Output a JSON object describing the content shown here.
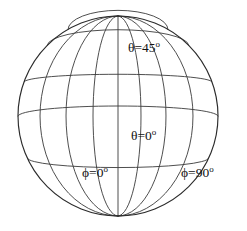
{
  "figure": {
    "background_color": "#ffffff",
    "line_color": "#3a3a3a",
    "text_color": "#111111"
  },
  "globe": {
    "center_x": 118,
    "center_y": 116,
    "radius": 100,
    "north_pole_label": "north-pole",
    "south_pole_label": "south-pole",
    "latitude_count": 5,
    "meridian_count": 7
  },
  "labels": {
    "theta_45": {
      "base": "θ=45",
      "degree": "o"
    },
    "theta_0": {
      "base": "θ=0",
      "degree": "o"
    },
    "phi_0": {
      "base": "ϕ=0",
      "degree": "o"
    },
    "phi_90": {
      "base": "ϕ=90",
      "degree": "o"
    }
  },
  "chart_data": {
    "type": "scatter",
    "xlabel": "",
    "ylabel": "",
    "projection": "orthographic",
    "grid": true,
    "legend_position": "none",
    "sphere": {
      "center": [
        118,
        116
      ],
      "radius": 100,
      "tilt_deg": 0
    },
    "latitudes": {
      "name": "latitude circles (constant theta)",
      "theta_values_deg": [
        60,
        45,
        20,
        0,
        -25
      ],
      "screen_y": [
        48,
        75,
        98,
        121,
        152
      ],
      "labeled": [
        "θ=45°",
        "θ=0°"
      ]
    },
    "meridians": {
      "name": "meridian arcs (constant phi)",
      "phi_values_deg": [
        0,
        22.5,
        45,
        67.5,
        90,
        112.5,
        135
      ],
      "equator_crossing_x": [
        43,
        70,
        95,
        118,
        143,
        170,
        196
      ],
      "labeled": [
        "ϕ=0°",
        "ϕ=90°"
      ]
    },
    "annotations": [
      {
        "text": "θ=45°",
        "x": 128,
        "y": 41
      },
      {
        "text": "θ=0°",
        "x": 131,
        "y": 129
      },
      {
        "text": "ϕ=0°",
        "x": 82,
        "y": 166
      },
      {
        "text": "ϕ=90°",
        "x": 181,
        "y": 166
      }
    ]
  }
}
